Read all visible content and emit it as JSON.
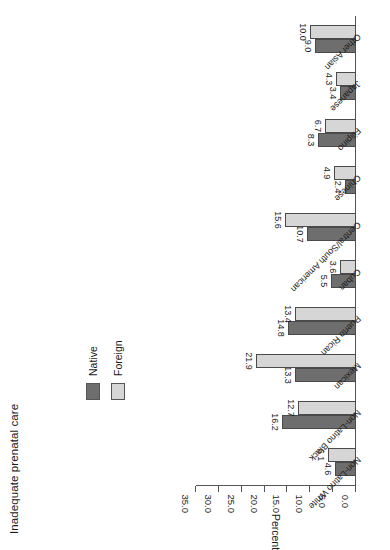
{
  "chart_data": {
    "type": "bar",
    "title": "Inadequate prenatal care",
    "xlabel": "",
    "ylabel": "Percent",
    "ylim": [
      0.0,
      35.0
    ],
    "yticks": [
      "0.0",
      "5.0",
      "10.0",
      "15.0",
      "20.0",
      "25.0",
      "30.0",
      "35.0"
    ],
    "ytick_values": [
      0.0,
      5.0,
      10.0,
      15.0,
      20.0,
      25.0,
      30.0,
      35.0
    ],
    "grid": false,
    "legend_position": "upper-left",
    "orientation": "rotated-90-ccw",
    "categories": [
      "Non-Latino White",
      "Non-Latino Black",
      "Mexican",
      "Puerto Rican",
      "Cuban",
      "Central/South American",
      "Chinese",
      "Filipino",
      "Japanese",
      "Other Asian"
    ],
    "series": [
      {
        "name": "Native",
        "color": "#6e6e6e",
        "values": [
          4.6,
          16.2,
          13.3,
          14.8,
          5.5,
          10.7,
          2.4,
          8.3,
          3.4,
          9.0
        ],
        "labels": [
          "4.6",
          "16.2",
          "13.3",
          "14.8",
          "5.5",
          "10.7",
          "2.4",
          "8.3",
          "3.4",
          "9.0"
        ]
      },
      {
        "name": "Foreign",
        "color": "#d6d6d6",
        "values": [
          6.1,
          12.7,
          21.9,
          13.4,
          3.6,
          15.6,
          4.9,
          6.7,
          4.3,
          10.0
        ],
        "labels": [
          "6.1",
          "12.7",
          "21.9",
          "13.4",
          "3.6",
          "15.6",
          "4.9",
          "6.7",
          "4.3",
          "10.0"
        ]
      }
    ]
  },
  "legend": {
    "entries": [
      {
        "label": "Native",
        "color": "#6e6e6e"
      },
      {
        "label": "Foreign",
        "color": "#d6d6d6"
      }
    ]
  }
}
